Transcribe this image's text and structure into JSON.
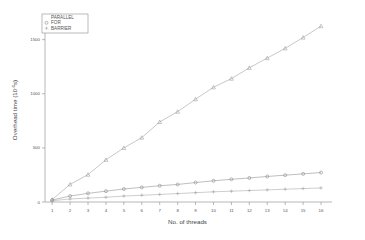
{
  "chart_data": {
    "type": "line",
    "title": "",
    "xlabel": "No. of threads",
    "ylabel": "Overhead time (10^-6 s)",
    "ylabel_parts": {
      "main": "Overhead time (10",
      "exp": "-6",
      "tail": "s)"
    },
    "x": [
      1,
      2,
      3,
      4,
      5,
      6,
      7,
      8,
      9,
      10,
      11,
      12,
      13,
      14,
      15,
      16
    ],
    "xtick_labels": [
      "1",
      "2",
      "3",
      "4",
      "5",
      "6",
      "7",
      "8",
      "9",
      "10",
      "11",
      "12",
      "13",
      "14",
      "15",
      "16"
    ],
    "ytick_labels": [
      "0",
      "500",
      "1000",
      "1500"
    ],
    "ytick_values": [
      0,
      500,
      1000,
      1500
    ],
    "xlim": [
      0.6,
      16.5
    ],
    "ylim": [
      0,
      1700
    ],
    "grid": false,
    "legend_position": "top-left",
    "series": [
      {
        "name": "PARALLEL",
        "marker": "triangle",
        "color": "#9b9b9b",
        "values": [
          22,
          163,
          253,
          390,
          500,
          595,
          740,
          835,
          950,
          1060,
          1140,
          1240,
          1330,
          1420,
          1520,
          1625
        ]
      },
      {
        "name": "FOR",
        "marker": "circle",
        "color": "#8a8a8a",
        "values": [
          18,
          55,
          80,
          100,
          120,
          135,
          150,
          162,
          180,
          196,
          210,
          222,
          236,
          248,
          260,
          272
        ]
      },
      {
        "name": "BARRIER",
        "marker": "plus",
        "color": "#a5a5a5",
        "values": [
          12,
          28,
          36,
          44,
          55,
          62,
          70,
          78,
          86,
          94,
          100,
          106,
          112,
          118,
          124,
          130
        ]
      }
    ]
  },
  "legend": {
    "entries": [
      {
        "label": "PARALLEL"
      },
      {
        "label": "FOR"
      },
      {
        "label": "BARRIER"
      }
    ]
  }
}
